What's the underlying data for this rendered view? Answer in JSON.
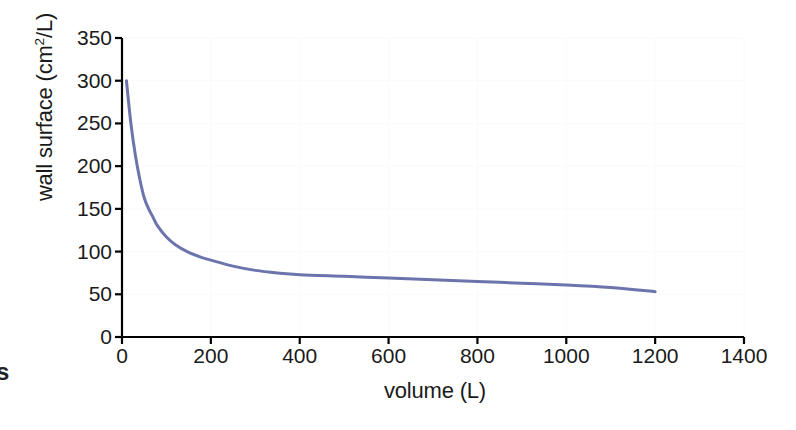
{
  "figure": {
    "background_color": "#ffffff",
    "axis_color": "#000000",
    "grid_color": "#fafafa",
    "series_color": "#6b74ad",
    "caption_fragment": "s"
  },
  "chart_data": {
    "type": "line",
    "title": "",
    "xlabel": "volume (L)",
    "ylabel_text": "wall surface (cm",
    "ylabel_sup": "2",
    "ylabel_tail": "/L)",
    "ylabel": "wall surface (cm2/L)",
    "xlim": [
      0,
      1400
    ],
    "ylim": [
      0,
      350
    ],
    "grid": true,
    "legend": null,
    "xticks": [
      0,
      200,
      400,
      600,
      800,
      1000,
      1200,
      1400
    ],
    "xtick_labels": [
      "0",
      "200",
      "400",
      "600",
      "800",
      "1000",
      "1200",
      "1400"
    ],
    "yticks": [
      0,
      50,
      100,
      150,
      200,
      250,
      300,
      350
    ],
    "ytick_labels": [
      "0",
      "50",
      "100",
      "150",
      "200",
      "250",
      "300",
      "350"
    ],
    "series": [
      {
        "name": "wall surface vs volume",
        "color": "#6b74ad",
        "line_width": 3,
        "x": [
          10,
          20,
          30,
          40,
          50,
          60,
          70,
          80,
          100,
          120,
          150,
          180,
          200,
          250,
          300,
          350,
          400,
          500,
          600,
          700,
          800,
          900,
          1000,
          1100,
          1200
        ],
        "y": [
          300,
          250,
          213,
          185,
          163,
          150,
          140,
          130,
          117,
          108,
          99,
          93,
          90,
          83,
          78,
          75,
          73,
          71,
          69,
          67,
          65,
          63,
          61,
          58,
          53
        ]
      }
    ]
  },
  "plot_geometry": {
    "left": 122,
    "right": 744,
    "top": 38,
    "bottom": 337
  }
}
